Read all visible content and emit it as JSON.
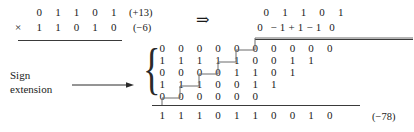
{
  "figure": {
    "operators": {
      "times": "×",
      "implies": "⇒"
    }
  },
  "multiplication": {
    "multiplicand": [
      "0",
      "1",
      "1",
      "0",
      "1"
    ],
    "multiplier": [
      "1",
      "1",
      "0",
      "1",
      "0"
    ],
    "multiplicand_value": "(+13)",
    "multiplier_value": "(−6)"
  },
  "recoded": {
    "multiplicand": [
      "0",
      "1",
      "1",
      "0",
      "1"
    ],
    "multiplier_digits": [
      "0",
      "−",
      "1",
      "+",
      "1",
      "−",
      "1",
      "0"
    ]
  },
  "sign_extension": {
    "line1": "Sign",
    "line2": "extension",
    "arrow_icon": "right-arrow-icon",
    "brace_icon": "left-curly-brace-icon"
  },
  "partial_products": [
    {
      "digits": [
        "0",
        "0",
        "0",
        "0",
        "0",
        "0",
        "0",
        "0",
        "0",
        "0"
      ]
    },
    {
      "digits": [
        "1",
        "1",
        "1",
        "1",
        "1",
        "0",
        "0",
        "1",
        "1"
      ]
    },
    {
      "digits": [
        "0",
        "0",
        "0",
        "0",
        "1",
        "1",
        "0",
        "1"
      ]
    },
    {
      "digits": [
        "1",
        "1",
        "1",
        "0",
        "0",
        "1",
        "1"
      ]
    },
    {
      "digits": [
        "0",
        "0",
        "0",
        "0",
        "0",
        "0"
      ]
    }
  ],
  "result": {
    "digits": [
      "1",
      "1",
      "1",
      "0",
      "1",
      "1",
      "0",
      "0",
      "1",
      "0"
    ],
    "value": "(−78)"
  },
  "colors": {
    "ink": "#1a1a1a",
    "rule": "#3a3a3a",
    "staircase": "#6b6b6b",
    "background": "#ffffff"
  }
}
